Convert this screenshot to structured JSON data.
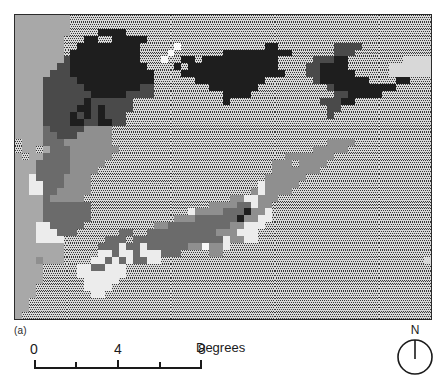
{
  "figure": {
    "panel_label": "(a)",
    "type": "raster-choropleth-map"
  },
  "scalebar": {
    "tick_labels": [
      "0",
      "4",
      "8"
    ],
    "tick_label_positions": [
      0,
      4,
      8
    ],
    "minor_ticks": [
      0,
      2,
      4,
      6,
      8
    ],
    "units_label": "Degrees",
    "min": 0,
    "max": 8
  },
  "north_arrow": {
    "label": "N"
  },
  "legend_colors": {
    "stipple_fill": "#d8d8d8",
    "stipple_dot": "#3a3a3a",
    "light": "#ececec",
    "lighter_gray": "#c9c9c9",
    "mid_gray": "#a8a8a8",
    "gray": "#8f8f8f",
    "dark_gray": "#6b6b6b",
    "darker_gray": "#4a4a4a",
    "black": "#1e1e1e",
    "frame": "#2b2b2b",
    "background": "#ffffff"
  },
  "chart_data": {
    "type": "heatmap",
    "title": "",
    "xlabel": "",
    "ylabel": "",
    "grid": false,
    "legend_position": "none",
    "cols": 60,
    "rows": 44,
    "cell_px": 7,
    "class_palette": {
      "0": "#d8d8d8",
      "1": "#c9c9c9",
      "2": "#a8a8a8",
      "3": "#8f8f8f",
      "4": "#6b6b6b",
      "5": "#4a4a4a",
      "6": "#1e1e1e",
      "7": "#ececec",
      "8": "#fafafa"
    },
    "stipple_classes": [
      0
    ],
    "rows_rle": [
      [
        [
          2,
          8
        ],
        [
          0,
          52
        ]
      ],
      [
        [
          2,
          8
        ],
        [
          0,
          52
        ]
      ],
      [
        [
          2,
          8
        ],
        [
          0,
          4
        ],
        [
          6,
          4
        ],
        [
          0,
          44
        ]
      ],
      [
        [
          2,
          7
        ],
        [
          0,
          3
        ],
        [
          6,
          2
        ],
        [
          0,
          2
        ],
        [
          6,
          5
        ],
        [
          0,
          41
        ]
      ],
      [
        [
          2,
          7
        ],
        [
          0,
          2
        ],
        [
          6,
          9
        ],
        [
          0,
          5
        ],
        [
          8,
          1
        ],
        [
          0,
          12
        ],
        [
          6,
          2
        ],
        [
          0,
          8
        ],
        [
          5,
          4
        ],
        [
          0,
          10
        ]
      ],
      [
        [
          2,
          7
        ],
        [
          0,
          1
        ],
        [
          6,
          10
        ],
        [
          0,
          4
        ],
        [
          8,
          1
        ],
        [
          0,
          7
        ],
        [
          6,
          10
        ],
        [
          0,
          6
        ],
        [
          5,
          3
        ],
        [
          0,
          11
        ]
      ],
      [
        [
          2,
          7
        ],
        [
          5,
          1
        ],
        [
          6,
          10
        ],
        [
          0,
          3
        ],
        [
          8,
          1
        ],
        [
          0,
          2
        ],
        [
          6,
          2
        ],
        [
          0,
          1
        ],
        [
          6,
          11
        ],
        [
          0,
          5
        ],
        [
          5,
          3
        ],
        [
          6,
          2
        ],
        [
          0,
          8
        ]
      ],
      [
        [
          2,
          6
        ],
        [
          5,
          2
        ],
        [
          6,
          11
        ],
        [
          0,
          4
        ],
        [
          6,
          1
        ],
        [
          0,
          1
        ],
        [
          6,
          13
        ],
        [
          0,
          4
        ],
        [
          5,
          2
        ],
        [
          6,
          4
        ],
        [
          0,
          6
        ]
      ],
      [
        [
          2,
          5
        ],
        [
          5,
          3
        ],
        [
          6,
          12
        ],
        [
          0,
          4
        ],
        [
          6,
          15
        ],
        [
          0,
          3
        ],
        [
          5,
          2
        ],
        [
          6,
          5
        ],
        [
          0,
          5
        ]
      ],
      [
        [
          2,
          4
        ],
        [
          5,
          5
        ],
        [
          6,
          11
        ],
        [
          0,
          6
        ],
        [
          6,
          10
        ],
        [
          0,
          7
        ],
        [
          5,
          1
        ],
        [
          6,
          7
        ],
        [
          0,
          4
        ],
        [
          6,
          2
        ],
        [
          0,
          3
        ]
      ],
      [
        [
          2,
          4
        ],
        [
          5,
          6
        ],
        [
          6,
          8
        ],
        [
          5,
          2
        ],
        [
          0,
          8
        ],
        [
          6,
          7
        ],
        [
          0,
          10
        ],
        [
          5,
          1
        ],
        [
          6,
          9
        ],
        [
          0,
          5
        ]
      ],
      [
        [
          2,
          4
        ],
        [
          5,
          7
        ],
        [
          6,
          5
        ],
        [
          5,
          4
        ],
        [
          0,
          10
        ],
        [
          6,
          4
        ],
        [
          0,
          12
        ],
        [
          5,
          2
        ],
        [
          6,
          5
        ],
        [
          0,
          7
        ]
      ],
      [
        [
          2,
          4
        ],
        [
          5,
          6
        ],
        [
          6,
          1
        ],
        [
          5,
          6
        ],
        [
          0,
          13
        ],
        [
          6,
          1
        ],
        [
          0,
          13
        ],
        [
          5,
          3
        ],
        [
          6,
          2
        ],
        [
          0,
          11
        ]
      ],
      [
        [
          2,
          4
        ],
        [
          5,
          5
        ],
        [
          6,
          2
        ],
        [
          5,
          1
        ],
        [
          6,
          1
        ],
        [
          5,
          4
        ],
        [
          0,
          28
        ],
        [
          5,
          2
        ],
        [
          0,
          13
        ]
      ],
      [
        [
          2,
          4
        ],
        [
          5,
          4
        ],
        [
          6,
          1
        ],
        [
          5,
          1
        ],
        [
          6,
          1
        ],
        [
          5,
          1
        ],
        [
          6,
          1
        ],
        [
          5,
          3
        ],
        [
          0,
          29
        ],
        [
          5,
          1
        ],
        [
          0,
          14
        ]
      ],
      [
        [
          2,
          4
        ],
        [
          5,
          4
        ],
        [
          6,
          2
        ],
        [
          5,
          2
        ],
        [
          6,
          2
        ],
        [
          5,
          2
        ],
        [
          0,
          44
        ]
      ],
      [
        [
          2,
          4
        ],
        [
          4,
          1
        ],
        [
          5,
          5
        ],
        [
          3,
          4
        ],
        [
          0,
          46
        ]
      ],
      [
        [
          2,
          4
        ],
        [
          4,
          2
        ],
        [
          5,
          3
        ],
        [
          3,
          5
        ],
        [
          0,
          46
        ]
      ],
      [
        [
          0,
          1
        ],
        [
          2,
          3
        ],
        [
          4,
          3
        ],
        [
          3,
          7
        ],
        [
          0,
          31
        ],
        [
          3,
          4
        ],
        [
          0,
          11
        ]
      ],
      [
        [
          0,
          1
        ],
        [
          2,
          2
        ],
        [
          0,
          1
        ],
        [
          2,
          1
        ],
        [
          4,
          3
        ],
        [
          3,
          7
        ],
        [
          0,
          28
        ],
        [
          3,
          5
        ],
        [
          0,
          12
        ]
      ],
      [
        [
          2,
          1
        ],
        [
          0,
          1
        ],
        [
          2,
          2
        ],
        [
          4,
          4
        ],
        [
          3,
          6
        ],
        [
          0,
          25
        ],
        [
          3,
          7
        ],
        [
          0,
          14
        ]
      ],
      [
        [
          2,
          3
        ],
        [
          4,
          5
        ],
        [
          3,
          5
        ],
        [
          0,
          24
        ],
        [
          3,
          3
        ],
        [
          0,
          1
        ],
        [
          3,
          4
        ],
        [
          0,
          15
        ]
      ],
      [
        [
          2,
          3
        ],
        [
          4,
          5
        ],
        [
          3,
          4
        ],
        [
          0,
          25
        ],
        [
          3,
          7
        ],
        [
          0,
          16
        ]
      ],
      [
        [
          2,
          2
        ],
        [
          7,
          1
        ],
        [
          4,
          4
        ],
        [
          3,
          4
        ],
        [
          0,
          25
        ],
        [
          3,
          6
        ],
        [
          0,
          18
        ]
      ],
      [
        [
          2,
          2
        ],
        [
          7,
          2
        ],
        [
          4,
          3
        ],
        [
          3,
          4
        ],
        [
          0,
          24
        ],
        [
          7,
          1
        ],
        [
          3,
          5
        ],
        [
          0,
          19
        ]
      ],
      [
        [
          2,
          2
        ],
        [
          7,
          2
        ],
        [
          4,
          2
        ],
        [
          3,
          5
        ],
        [
          0,
          23
        ],
        [
          3,
          1
        ],
        [
          7,
          1
        ],
        [
          3,
          4
        ],
        [
          0,
          22
        ]
      ],
      [
        [
          2,
          4
        ],
        [
          4,
          1
        ],
        [
          3,
          5
        ],
        [
          0,
          21
        ],
        [
          3,
          2
        ],
        [
          7,
          2
        ],
        [
          3,
          3
        ],
        [
          0,
          23
        ]
      ],
      [
        [
          2,
          4
        ],
        [
          4,
          7
        ],
        [
          0,
          17
        ],
        [
          3,
          4
        ],
        [
          4,
          2
        ],
        [
          7,
          1
        ],
        [
          3,
          2
        ],
        [
          0,
          23
        ]
      ],
      [
        [
          2,
          4
        ],
        [
          4,
          7
        ],
        [
          0,
          14
        ],
        [
          7,
          1
        ],
        [
          3,
          4
        ],
        [
          4,
          3
        ],
        [
          6,
          1
        ],
        [
          3,
          2
        ],
        [
          7,
          1
        ],
        [
          0,
          23
        ]
      ],
      [
        [
          2,
          4
        ],
        [
          4,
          7
        ],
        [
          0,
          12
        ],
        [
          3,
          3
        ],
        [
          4,
          6
        ],
        [
          6,
          1
        ],
        [
          3,
          2
        ],
        [
          7,
          2
        ],
        [
          0,
          23
        ]
      ],
      [
        [
          2,
          3
        ],
        [
          7,
          2
        ],
        [
          4,
          5
        ],
        [
          0,
          10
        ],
        [
          3,
          2
        ],
        [
          4,
          9
        ],
        [
          3,
          2
        ],
        [
          7,
          3
        ],
        [
          0,
          24
        ]
      ],
      [
        [
          2,
          3
        ],
        [
          7,
          3
        ],
        [
          4,
          3
        ],
        [
          0,
          6
        ],
        [
          4,
          2
        ],
        [
          0,
          2
        ],
        [
          4,
          10
        ],
        [
          3,
          3
        ],
        [
          7,
          3
        ],
        [
          0,
          25
        ]
      ],
      [
        [
          2,
          3
        ],
        [
          7,
          4
        ],
        [
          0,
          6
        ],
        [
          4,
          3
        ],
        [
          0,
          1
        ],
        [
          4,
          13
        ],
        [
          7,
          1
        ],
        [
          3,
          2
        ],
        [
          7,
          2
        ],
        [
          0,
          25
        ]
      ],
      [
        [
          2,
          7
        ],
        [
          0,
          5
        ],
        [
          4,
          3
        ],
        [
          7,
          1
        ],
        [
          4,
          2
        ],
        [
          7,
          1
        ],
        [
          4,
          6
        ],
        [
          3,
          2
        ],
        [
          8,
          1
        ],
        [
          3,
          2
        ],
        [
          7,
          1
        ],
        [
          0,
          29
        ]
      ],
      [
        [
          2,
          7
        ],
        [
          0,
          5
        ],
        [
          7,
          2
        ],
        [
          4,
          1
        ],
        [
          7,
          2
        ],
        [
          4,
          1
        ],
        [
          7,
          3
        ],
        [
          4,
          3
        ],
        [
          0,
          4
        ],
        [
          3,
          2
        ],
        [
          0,
          30
        ]
      ],
      [
        [
          2,
          3
        ],
        [
          3,
          1
        ],
        [
          2,
          3
        ],
        [
          0,
          4
        ],
        [
          7,
          2
        ],
        [
          4,
          1
        ],
        [
          7,
          1
        ],
        [
          4,
          1
        ],
        [
          7,
          1
        ],
        [
          4,
          2
        ],
        [
          7,
          2
        ],
        [
          0,
          38
        ]
      ],
      [
        [
          2,
          4
        ],
        [
          0,
          5
        ],
        [
          7,
          2
        ],
        [
          4,
          2
        ],
        [
          7,
          3
        ],
        [
          0,
          44
        ]
      ],
      [
        [
          2,
          4
        ],
        [
          0,
          5
        ],
        [
          7,
          7
        ],
        [
          0,
          44
        ]
      ],
      [
        [
          2,
          4
        ],
        [
          0,
          6
        ],
        [
          7,
          5
        ],
        [
          0,
          45
        ]
      ],
      [
        [
          2,
          3
        ],
        [
          0,
          7
        ],
        [
          7,
          4
        ],
        [
          0,
          46
        ]
      ],
      [
        [
          2,
          3
        ],
        [
          0,
          8
        ],
        [
          7,
          2
        ],
        [
          0,
          47
        ]
      ],
      [
        [
          2,
          2
        ],
        [
          0,
          58
        ]
      ],
      [
        [
          2,
          2
        ],
        [
          0,
          58
        ]
      ],
      [
        [
          2,
          1
        ],
        [
          0,
          59
        ]
      ]
    ]
  }
}
